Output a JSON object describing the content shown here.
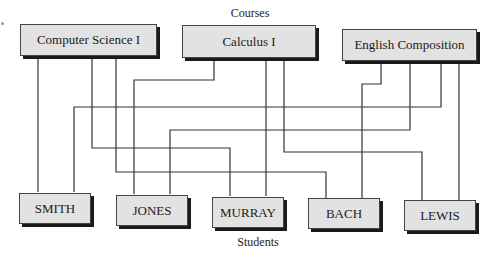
{
  "diagram": {
    "top_label": "Courses",
    "bottom_label": "Students",
    "courses": [
      {
        "id": "cs1",
        "name": "Computer Science I"
      },
      {
        "id": "calc1",
        "name": "Calculus I"
      },
      {
        "id": "eng",
        "name": "English Composition"
      }
    ],
    "students": [
      {
        "id": "smith",
        "name": "SMITH"
      },
      {
        "id": "jones",
        "name": "JONES"
      },
      {
        "id": "murray",
        "name": "MURRAY"
      },
      {
        "id": "bach",
        "name": "BACH"
      },
      {
        "id": "lewis",
        "name": "LEWIS"
      }
    ],
    "enrollments": [
      {
        "course": "Computer Science I",
        "student": "SMITH"
      },
      {
        "course": "Computer Science I",
        "student": "MURRAY"
      },
      {
        "course": "Computer Science I",
        "student": "BACH"
      },
      {
        "course": "Calculus I",
        "student": "JONES"
      },
      {
        "course": "Calculus I",
        "student": "MURRAY"
      },
      {
        "course": "Calculus I",
        "student": "LEWIS"
      },
      {
        "course": "English Composition",
        "student": "BACH"
      },
      {
        "course": "English Composition",
        "student": "JONES"
      },
      {
        "course": "English Composition",
        "student": "SMITH"
      },
      {
        "course": "English Composition",
        "student": "LEWIS"
      }
    ]
  }
}
